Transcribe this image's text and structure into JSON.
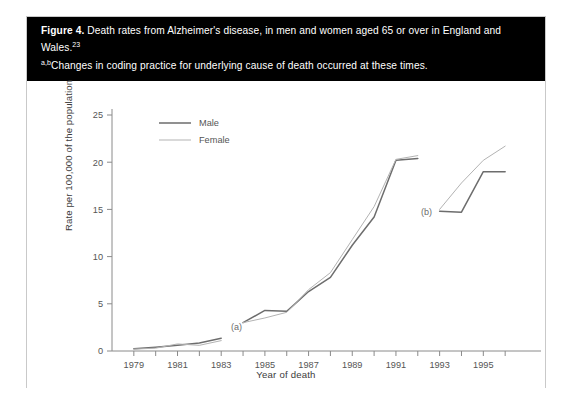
{
  "figure": {
    "label": "Figure 4.",
    "caption_main": "Death rates from Alzheimer's disease, in men and women aged 65 or over in England and Wales.",
    "caption_ref": "23",
    "footnote_marker": "a,b",
    "footnote_text": "Changes in coding practice for underlying cause of death occurred at these times."
  },
  "colors": {
    "caption_bg": "#000000",
    "caption_fg": "#ffffff",
    "card_border": "#c9c9c9",
    "axis": "#8a8a8a",
    "male_line": "#6d6d6d",
    "female_line": "#b3b3b3",
    "tick_text": "#555555",
    "annotation_text": "#6b6b6b"
  },
  "chart_data": {
    "type": "line",
    "title": "Death rates from Alzheimer's disease, in men and women aged 65 or over in England and Wales",
    "xlabel": "Year of death",
    "ylabel": "Rate per 100,000 of the population",
    "xlim": [
      1978,
      1997
    ],
    "ylim": [
      0,
      25
    ],
    "yticks": [
      0,
      5,
      10,
      15,
      20,
      25
    ],
    "ytick_labels": [
      "0",
      "5",
      "10",
      "15",
      "20",
      "25"
    ],
    "xticks": [
      1979,
      1980,
      1981,
      1982,
      1983,
      1984,
      1985,
      1986,
      1987,
      1988,
      1989,
      1990,
      1991,
      1992,
      1993,
      1994,
      1995,
      1996
    ],
    "xtick_labels": [
      "1979",
      "",
      "1981",
      "",
      "1983",
      "",
      "1985",
      "",
      "1987",
      "",
      "1989",
      "",
      "1991",
      "",
      "1993",
      "",
      "1995",
      ""
    ],
    "grid": false,
    "legend_position": "top-left",
    "legend": [
      "Male",
      "Female"
    ],
    "annotations": [
      {
        "text": "(a)",
        "x": 1983.7,
        "y": 2.2
      },
      {
        "text": "(b)",
        "x": 1992.4,
        "y": 14.4
      }
    ],
    "segments": [
      {
        "name": "segment-1",
        "x": [
          1979,
          1980,
          1981,
          1982,
          1983
        ],
        "series": [
          {
            "name": "Male",
            "values": [
              0.25,
              0.4,
              0.6,
              0.85,
              1.35
            ]
          },
          {
            "name": "Female",
            "values": [
              0.2,
              0.3,
              0.75,
              0.6,
              1.1
            ]
          }
        ]
      },
      {
        "name": "segment-2",
        "x": [
          1984,
          1985,
          1986,
          1987,
          1988,
          1989,
          1990,
          1991,
          1992
        ],
        "series": [
          {
            "name": "Male",
            "values": [
              3.0,
              4.3,
              4.2,
              6.3,
              7.8,
              11.2,
              14.2,
              20.2,
              20.4
            ]
          },
          {
            "name": "Female",
            "values": [
              3.0,
              3.5,
              4.1,
              6.5,
              8.3,
              11.8,
              15.3,
              20.3,
              20.7
            ]
          }
        ]
      },
      {
        "name": "segment-3",
        "x": [
          1993,
          1994,
          1995,
          1996
        ],
        "series": [
          {
            "name": "Male",
            "values": [
              14.8,
              14.7,
              19.0,
              19.0
            ]
          },
          {
            "name": "Female",
            "values": [
              15.0,
              17.8,
              20.2,
              21.7
            ]
          }
        ]
      }
    ]
  }
}
